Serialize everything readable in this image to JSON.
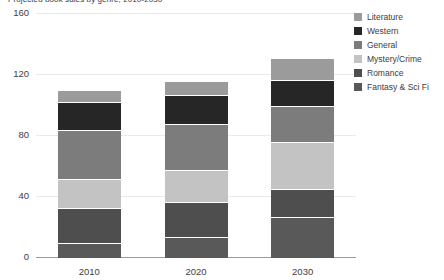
{
  "chart_data": {
    "type": "bar",
    "subtype": "stacked-vertical",
    "title": "Projected book sales by genre, 2010-2030",
    "xlabel": "",
    "ylabel": "",
    "categories": [
      "2010",
      "2020",
      "2030"
    ],
    "ylim": [
      0,
      160
    ],
    "yticks": [
      0,
      40,
      80,
      120,
      160
    ],
    "ytick_labels": [
      "0",
      "40",
      "80",
      "120",
      "160"
    ],
    "grid": true,
    "legend_position": "right",
    "series": [
      {
        "name": "Fantasy & Sci Fi",
        "color": "#595959",
        "values": [
          10,
          14,
          27
        ]
      },
      {
        "name": "Romance",
        "color": "#4e4e4e",
        "values": [
          23,
          23,
          18
        ]
      },
      {
        "name": "Mystery/Crime",
        "color": "#c3c3c3",
        "values": [
          19,
          21,
          31
        ]
      },
      {
        "name": "General",
        "color": "#7c7c7c",
        "values": [
          32,
          30,
          24
        ]
      },
      {
        "name": "Western",
        "color": "#262626",
        "values": [
          18,
          19,
          17
        ]
      },
      {
        "name": "Literature",
        "color": "#9b9b9b",
        "values": [
          8,
          9,
          14
        ]
      }
    ],
    "totals": [
      110,
      116,
      131
    ]
  },
  "legend": {
    "items": [
      {
        "label": "Literature",
        "color": "#9b9b9b"
      },
      {
        "label": "Western",
        "color": "#262626"
      },
      {
        "label": "General",
        "color": "#7c7c7c"
      },
      {
        "label": "Mystery/Crime",
        "color": "#c3c3c3"
      },
      {
        "label": "Romance",
        "color": "#4e4e4e"
      },
      {
        "label": "Fantasy & Sci Fi",
        "color": "#595959"
      }
    ]
  },
  "colors": {
    "gridline": "#e9e9e9",
    "axis": "#9a9a9a",
    "text": "#3d3d3d",
    "background": "#ffffff"
  }
}
